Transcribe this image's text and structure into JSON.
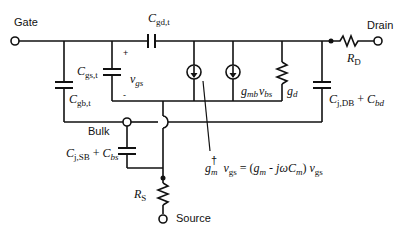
{
  "terminals": {
    "gate": "Gate",
    "drain": "Drain",
    "bulk": "Bulk",
    "source": "Source"
  },
  "components": {
    "cgd": {
      "sym": "C",
      "sub": "gd,t"
    },
    "cgs": {
      "sym": "C",
      "sub": "gs,t"
    },
    "cgb": {
      "sym": "C",
      "sub": "gb,t"
    },
    "vgs": {
      "sym": "v",
      "sub": "gs"
    },
    "plus": "+",
    "minus": "-",
    "gmb": {
      "sym": "g",
      "sub": "mb",
      "v": "v",
      "vsub": "bs"
    },
    "gd": {
      "sym": "g",
      "sub": "d"
    },
    "cjdb": {
      "c1": "C",
      "c1sub": "j,DB",
      "plus": " + ",
      "c2": "C",
      "c2sub": "bd"
    },
    "rd": {
      "sym": "R",
      "sub": "D"
    },
    "cjsb": {
      "c1": "C",
      "c1sub": "j,SB",
      "plus": " + ",
      "c2": "C",
      "c2sub": "bs"
    },
    "rs": {
      "sym": "R",
      "sub": "S"
    }
  },
  "annotation": {
    "gm": "g",
    "gm_sub": "m",
    "dagger": "†",
    "v1": "v",
    "v1sub": "gs",
    "eq": " = (",
    "g2": "g",
    "g2sub": "m",
    "mid": " - jωC",
    "cmsub": "m",
    "close": ") ",
    "v2": "v",
    "v2sub": "gs"
  }
}
